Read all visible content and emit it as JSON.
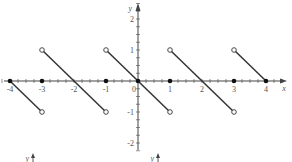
{
  "chart_data": {
    "type": "line",
    "title": "",
    "xlabel": "x",
    "ylabel": "y",
    "xlim": [
      -4,
      4
    ],
    "ylim": [
      -2,
      3
    ],
    "grid": false,
    "x_ticks": [
      -4,
      -3,
      -2,
      -1,
      0,
      1,
      2,
      3,
      4
    ],
    "x_tick_labels": [
      "-4",
      "-3",
      "-2",
      "-1",
      "0",
      "1",
      "2",
      "3",
      "4"
    ],
    "y_ticks": [
      -2,
      -1,
      1,
      2,
      3
    ],
    "y_tick_labels": [
      "-2",
      "-1",
      "1",
      "2",
      "3"
    ],
    "segments": [
      {
        "from": [
          -4,
          0
        ],
        "to": [
          -3,
          -1
        ],
        "start": "closed",
        "end": "open"
      },
      {
        "from": [
          -3,
          1
        ],
        "to": [
          -1,
          -1
        ],
        "start": "open",
        "end": "open"
      },
      {
        "from": [
          -1,
          1
        ],
        "to": [
          1,
          -1
        ],
        "start": "open",
        "end": "open"
      },
      {
        "from": [
          1,
          1
        ],
        "to": [
          3,
          -1
        ],
        "start": "open",
        "end": "open"
      },
      {
        "from": [
          3,
          1
        ],
        "to": [
          4,
          0
        ],
        "start": "open",
        "end": "closed"
      }
    ],
    "isolated_points": [
      [
        -4,
        0
      ],
      [
        -3,
        0
      ],
      [
        -1,
        0
      ],
      [
        0,
        0
      ],
      [
        1,
        0
      ],
      [
        3,
        0
      ],
      [
        4,
        0
      ]
    ],
    "line_color": "#333333",
    "axis_color": "#444444"
  },
  "partial_figures_below": [
    {
      "label": "y"
    },
    {
      "label": "y"
    }
  ]
}
